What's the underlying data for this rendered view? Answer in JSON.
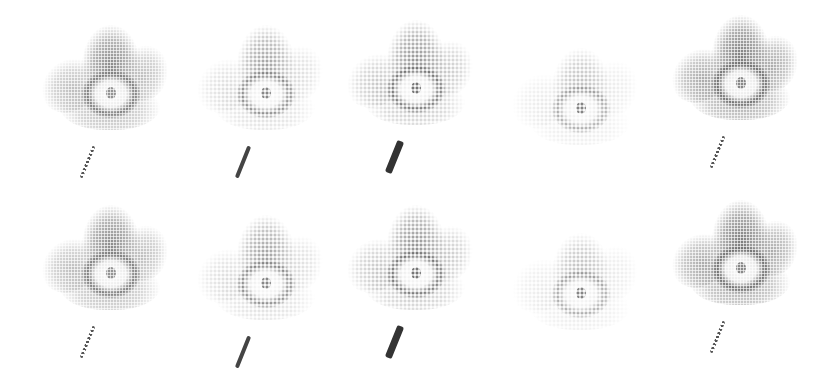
{
  "figure": {
    "rows": 2,
    "cols": 5,
    "background": "#ffffff"
  },
  "cells": [
    {
      "row": 0,
      "col": 0,
      "x": 40,
      "y": 25,
      "style": "dense",
      "tone": "#7a7a7a",
      "petal_tone": "#b5b5b5",
      "stem": "dotted",
      "stem_tone": "#555555"
    },
    {
      "row": 0,
      "col": 1,
      "x": 195,
      "y": 25,
      "style": "sparse",
      "tone": "#6a6a6a",
      "petal_tone": "#c8c8c8",
      "stem": "solid-thin",
      "stem_tone": "#444444"
    },
    {
      "row": 0,
      "col": 2,
      "x": 345,
      "y": 20,
      "style": "sparse-dark",
      "tone": "#555555",
      "petal_tone": "#a8a8a8",
      "stem": "solid-thick",
      "stem_tone": "#333333"
    },
    {
      "row": 0,
      "col": 3,
      "x": 510,
      "y": 40,
      "style": "very-sparse",
      "tone": "#666666",
      "petal_tone": "#d0d0d0",
      "stem": "none",
      "stem_tone": "#ffffff"
    },
    {
      "row": 0,
      "col": 4,
      "x": 670,
      "y": 15,
      "style": "dense",
      "tone": "#6d6d6d",
      "petal_tone": "#a0a0a0",
      "stem": "dotted",
      "stem_tone": "#555555"
    },
    {
      "row": 1,
      "col": 0,
      "x": 40,
      "y": 205,
      "style": "dense",
      "tone": "#7a7a7a",
      "petal_tone": "#b5b5b5",
      "stem": "dotted",
      "stem_tone": "#555555"
    },
    {
      "row": 1,
      "col": 1,
      "x": 195,
      "y": 215,
      "style": "sparse",
      "tone": "#6a6a6a",
      "petal_tone": "#c8c8c8",
      "stem": "solid-thin",
      "stem_tone": "#444444"
    },
    {
      "row": 1,
      "col": 2,
      "x": 345,
      "y": 205,
      "style": "sparse-dark",
      "tone": "#555555",
      "petal_tone": "#a8a8a8",
      "stem": "solid-thick",
      "stem_tone": "#333333"
    },
    {
      "row": 1,
      "col": 3,
      "x": 510,
      "y": 225,
      "style": "very-sparse",
      "tone": "#666666",
      "petal_tone": "#d0d0d0",
      "stem": "none",
      "stem_tone": "#ffffff"
    },
    {
      "row": 1,
      "col": 4,
      "x": 670,
      "y": 200,
      "style": "dense",
      "tone": "#6d6d6d",
      "petal_tone": "#a0a0a0",
      "stem": "dotted",
      "stem_tone": "#555555"
    }
  ]
}
